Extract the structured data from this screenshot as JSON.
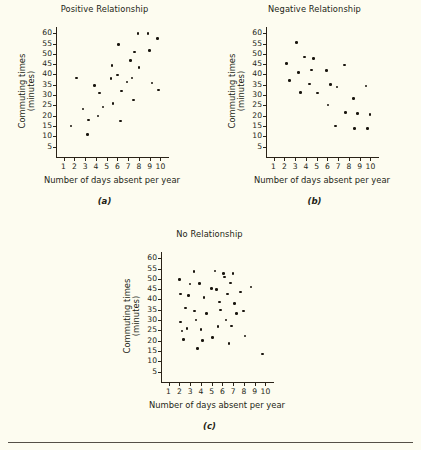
{
  "figure": {
    "background_color": "#fdfcf0",
    "axis_color": "#2a2318",
    "dot_color": "#19150e",
    "text_color": "#241f16"
  },
  "chart_data": [
    {
      "type": "scatter",
      "panel": "a",
      "caption": "(a)",
      "title": "Positive Relationship",
      "xlabel": "Number of days absent per year",
      "ylabel": "Commuting times (minutes)",
      "ylabel_line1": "Commuting times",
      "ylabel_line2": "(minutes)",
      "xlim": [
        0.3,
        10.7
      ],
      "ylim": [
        0,
        63
      ],
      "xticks": [
        1,
        2,
        3,
        4,
        5,
        6,
        7,
        8,
        9,
        10
      ],
      "yticks": [
        5,
        10,
        15,
        20,
        25,
        30,
        35,
        40,
        45,
        50,
        55,
        60
      ],
      "grid": false,
      "legend": null,
      "points": [
        [
          1.7,
          15.0
        ],
        [
          2.2,
          38.2
        ],
        [
          2.8,
          23.2
        ],
        [
          3.2,
          11.0
        ],
        [
          3.3,
          17.9
        ],
        [
          3.9,
          34.6
        ],
        [
          4.2,
          19.8
        ],
        [
          4.35,
          31.0
        ],
        [
          4.65,
          24.3
        ],
        [
          5.4,
          38.0
        ],
        [
          5.5,
          44.2
        ],
        [
          5.6,
          26.0
        ],
        [
          6.0,
          39.8
        ],
        [
          6.1,
          54.4
        ],
        [
          6.3,
          17.5
        ],
        [
          6.4,
          32.0
        ],
        [
          6.9,
          36.3
        ],
        [
          7.2,
          46.8
        ],
        [
          7.35,
          38.2
        ],
        [
          7.5,
          27.6
        ],
        [
          7.6,
          50.8
        ],
        [
          7.9,
          59.8
        ],
        [
          8.0,
          43.5
        ],
        [
          8.85,
          59.9
        ],
        [
          9.0,
          51.7
        ],
        [
          9.2,
          35.8
        ],
        [
          9.75,
          57.3
        ],
        [
          9.8,
          32.4
        ]
      ]
    },
    {
      "type": "scatter",
      "panel": "b",
      "caption": "(b)",
      "title": "Negative Relationship",
      "xlabel": "Number of days absent per year",
      "ylabel": "Commuting times (minutes)",
      "ylabel_line1": "Commuting times",
      "ylabel_line2": "(minutes)",
      "xlim": [
        0.3,
        10.7
      ],
      "ylim": [
        0,
        63
      ],
      "xticks": [
        1,
        2,
        3,
        4,
        5,
        6,
        7,
        8,
        9,
        10
      ],
      "yticks": [
        5,
        10,
        15,
        20,
        25,
        30,
        35,
        40,
        45,
        50,
        55,
        60
      ],
      "grid": false,
      "legend": null,
      "points": [
        [
          2.2,
          45.2
        ],
        [
          2.5,
          37.0
        ],
        [
          3.15,
          55.4
        ],
        [
          3.3,
          41.0
        ],
        [
          3.5,
          31.3
        ],
        [
          3.85,
          48.4
        ],
        [
          4.35,
          35.4
        ],
        [
          4.5,
          42.2
        ],
        [
          4.7,
          47.7
        ],
        [
          5.1,
          31.0
        ],
        [
          5.9,
          41.9
        ],
        [
          6.05,
          25.2
        ],
        [
          6.3,
          35.1
        ],
        [
          6.75,
          15.0
        ],
        [
          6.9,
          33.9
        ],
        [
          7.6,
          44.5
        ],
        [
          7.7,
          21.6
        ],
        [
          8.4,
          28.3
        ],
        [
          8.5,
          13.9
        ],
        [
          8.8,
          21.2
        ],
        [
          9.6,
          34.5
        ],
        [
          9.7,
          13.9
        ],
        [
          9.95,
          20.6
        ]
      ]
    },
    {
      "type": "scatter",
      "panel": "c",
      "caption": "(c)",
      "title": "No Relationship",
      "xlabel": "Number of days absent per year",
      "ylabel": "Commuting times (minutes)",
      "ylabel_line1": "Commuting times",
      "ylabel_line2": "(minutes)",
      "xlim": [
        0.3,
        10.7
      ],
      "ylim": [
        0,
        63
      ],
      "xticks": [
        1,
        2,
        3,
        4,
        5,
        6,
        7,
        8,
        9,
        10
      ],
      "yticks": [
        5,
        10,
        15,
        20,
        25,
        30,
        35,
        40,
        45,
        50,
        55,
        60
      ],
      "grid": false,
      "legend": null,
      "points": [
        [
          2.0,
          49.7
        ],
        [
          2.1,
          42.6
        ],
        [
          2.1,
          29.0
        ],
        [
          2.25,
          24.8
        ],
        [
          2.4,
          20.5
        ],
        [
          2.55,
          35.9
        ],
        [
          2.7,
          25.8
        ],
        [
          2.85,
          41.8
        ],
        [
          3.0,
          47.5
        ],
        [
          3.35,
          53.6
        ],
        [
          3.4,
          34.5
        ],
        [
          3.55,
          30.0
        ],
        [
          3.7,
          16.3
        ],
        [
          3.85,
          47.8
        ],
        [
          4.0,
          25.3
        ],
        [
          4.15,
          20.1
        ],
        [
          4.3,
          41.0
        ],
        [
          4.5,
          33.3
        ],
        [
          5.0,
          45.4
        ],
        [
          5.1,
          21.5
        ],
        [
          5.3,
          53.7
        ],
        [
          5.45,
          44.9
        ],
        [
          5.6,
          26.8
        ],
        [
          5.75,
          38.8
        ],
        [
          5.85,
          34.8
        ],
        [
          6.1,
          52.5
        ],
        [
          6.2,
          50.9
        ],
        [
          6.35,
          30.0
        ],
        [
          6.5,
          42.7
        ],
        [
          6.6,
          18.8
        ],
        [
          6.75,
          48.0
        ],
        [
          6.85,
          27.2
        ],
        [
          7.0,
          52.7
        ],
        [
          7.1,
          37.9
        ],
        [
          7.3,
          33.2
        ],
        [
          7.7,
          43.6
        ],
        [
          7.95,
          34.5
        ],
        [
          8.1,
          22.3
        ],
        [
          8.65,
          46.0
        ],
        [
          9.75,
          13.5
        ]
      ]
    }
  ]
}
